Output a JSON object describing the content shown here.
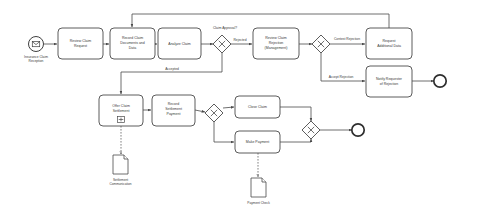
{
  "diagram": {
    "type": "bpmn-process",
    "background": "#ffffff",
    "stroke_color": "#4a4a4a",
    "text_color": "#3a3a3a"
  },
  "events": {
    "start": {
      "id": "start-event",
      "label": "Insurance Claim Reception",
      "label_line1": "Insurance Claim",
      "label_line2": "Reception",
      "icon": "envelope-icon",
      "x": 36,
      "y": 45
    },
    "end_rejection": {
      "id": "end-event-rejection",
      "label": "",
      "x": 440,
      "y": 81
    },
    "end_closed": {
      "id": "end-event-closed",
      "label": "",
      "x": 358,
      "y": 130
    }
  },
  "tasks": [
    {
      "id": "task-review-claim-request",
      "label": "Review Claim Request",
      "lines": [
        "Review Claim",
        "Request"
      ],
      "x": 58,
      "y": 28,
      "w": 45,
      "h": 31,
      "marker": "none"
    },
    {
      "id": "task-record-claim-documents",
      "label": "Record Claim Documents and Data",
      "lines": [
        "Record Claim",
        "Documents and",
        "Data"
      ],
      "x": 110,
      "y": 28,
      "w": 45,
      "h": 31,
      "marker": "none"
    },
    {
      "id": "task-analyze-claim",
      "label": "Analyze Claim",
      "lines": [
        "Analyze Claim"
      ],
      "x": 158,
      "y": 28,
      "w": 43,
      "h": 31,
      "marker": "none"
    },
    {
      "id": "task-review-claim-rejection",
      "label": "Review Claim Rejection (Management)",
      "lines": [
        "Review Claim",
        "Rejection",
        "(Management)"
      ],
      "x": 253,
      "y": 28,
      "w": 46,
      "h": 31,
      "marker": "none"
    },
    {
      "id": "task-request-additional-data",
      "label": "Request Additional Data",
      "lines": [
        "Request",
        "Additional Data"
      ],
      "x": 366,
      "y": 28,
      "w": 46,
      "h": 31,
      "marker": "none"
    },
    {
      "id": "task-notify-requester-rejection",
      "label": "Notify Requester of Rejection",
      "lines": [
        "Notify Requester",
        "of Rejection"
      ],
      "x": 366,
      "y": 66,
      "w": 46,
      "h": 31,
      "marker": "none"
    },
    {
      "id": "task-offer-claim-settlement",
      "label": "Offer Claim Settlement",
      "lines": [
        "Offer Claim",
        "Settlement"
      ],
      "x": 99,
      "y": 95,
      "w": 44,
      "h": 31,
      "marker": "subprocess"
    },
    {
      "id": "task-record-settlement-payment",
      "label": "Record Settlement Payment",
      "lines": [
        "Record",
        "Settlement",
        "Payment"
      ],
      "x": 152,
      "y": 95,
      "w": 43,
      "h": 31,
      "marker": "none"
    },
    {
      "id": "task-close-claim",
      "label": "Close Claim",
      "lines": [
        "Close Claim"
      ],
      "x": 235,
      "y": 96,
      "w": 45,
      "h": 22,
      "marker": "none"
    },
    {
      "id": "task-make-payment",
      "label": "Make Payment",
      "lines": [
        "Make Payment"
      ],
      "x": 235,
      "y": 131,
      "w": 45,
      "h": 22,
      "marker": "none"
    }
  ],
  "gateways": [
    {
      "id": "gateway-claim-approval",
      "label": "Claim Approval?",
      "type": "exclusive",
      "cx": 222,
      "cy": 44
    },
    {
      "id": "gateway-rejection-decision",
      "label": "",
      "type": "exclusive",
      "cx": 321,
      "cy": 44
    },
    {
      "id": "gateway-settlement-split",
      "label": "",
      "type": "exclusive",
      "cx": 214,
      "cy": 113
    },
    {
      "id": "gateway-settlement-merge",
      "label": "",
      "type": "exclusive",
      "cx": 311,
      "cy": 130
    }
  ],
  "flow_labels": [
    {
      "id": "flow-label-rejected",
      "text": "Rejected",
      "x": 238,
      "y": 40
    },
    {
      "id": "flow-label-accepted",
      "text": "Accepted",
      "x": 172,
      "y": 76
    },
    {
      "id": "flow-label-contest-rejection",
      "text": "Contest Rejection",
      "x": 345,
      "y": 39
    },
    {
      "id": "flow-label-accept-rejection",
      "text": "Accept Rejection",
      "x": 341,
      "y": 79
    }
  ],
  "data_objects": [
    {
      "id": "data-object-settlement-communication",
      "label": "Settlement Communication",
      "lines": [
        "Settlement",
        "Communication"
      ],
      "x": 113,
      "y": 155,
      "w": 15,
      "h": 19
    },
    {
      "id": "data-object-payment-check",
      "label": "Payment Check",
      "lines": [
        "Payment Check"
      ],
      "x": 251,
      "y": 178,
      "w": 15,
      "h": 19
    }
  ]
}
